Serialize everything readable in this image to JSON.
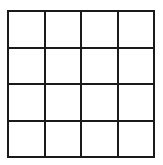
{
  "figure": {
    "name": "empty-grid",
    "type": "grid",
    "columns": 4,
    "rows": 4,
    "cell_count": 16,
    "line_color": "#1a1a1a",
    "cell_color": "#ffffff",
    "background_color": "#ffffff",
    "line_width_px": 2,
    "cell_size_px": 35,
    "grid_left_px": 7,
    "grid_top_px": 10,
    "grid_width_px": 148,
    "grid_height_px": 148,
    "cells": [
      [
        "",
        "",
        "",
        ""
      ],
      [
        "",
        "",
        "",
        ""
      ],
      [
        "",
        "",
        "",
        ""
      ],
      [
        "",
        "",
        "",
        ""
      ]
    ]
  }
}
